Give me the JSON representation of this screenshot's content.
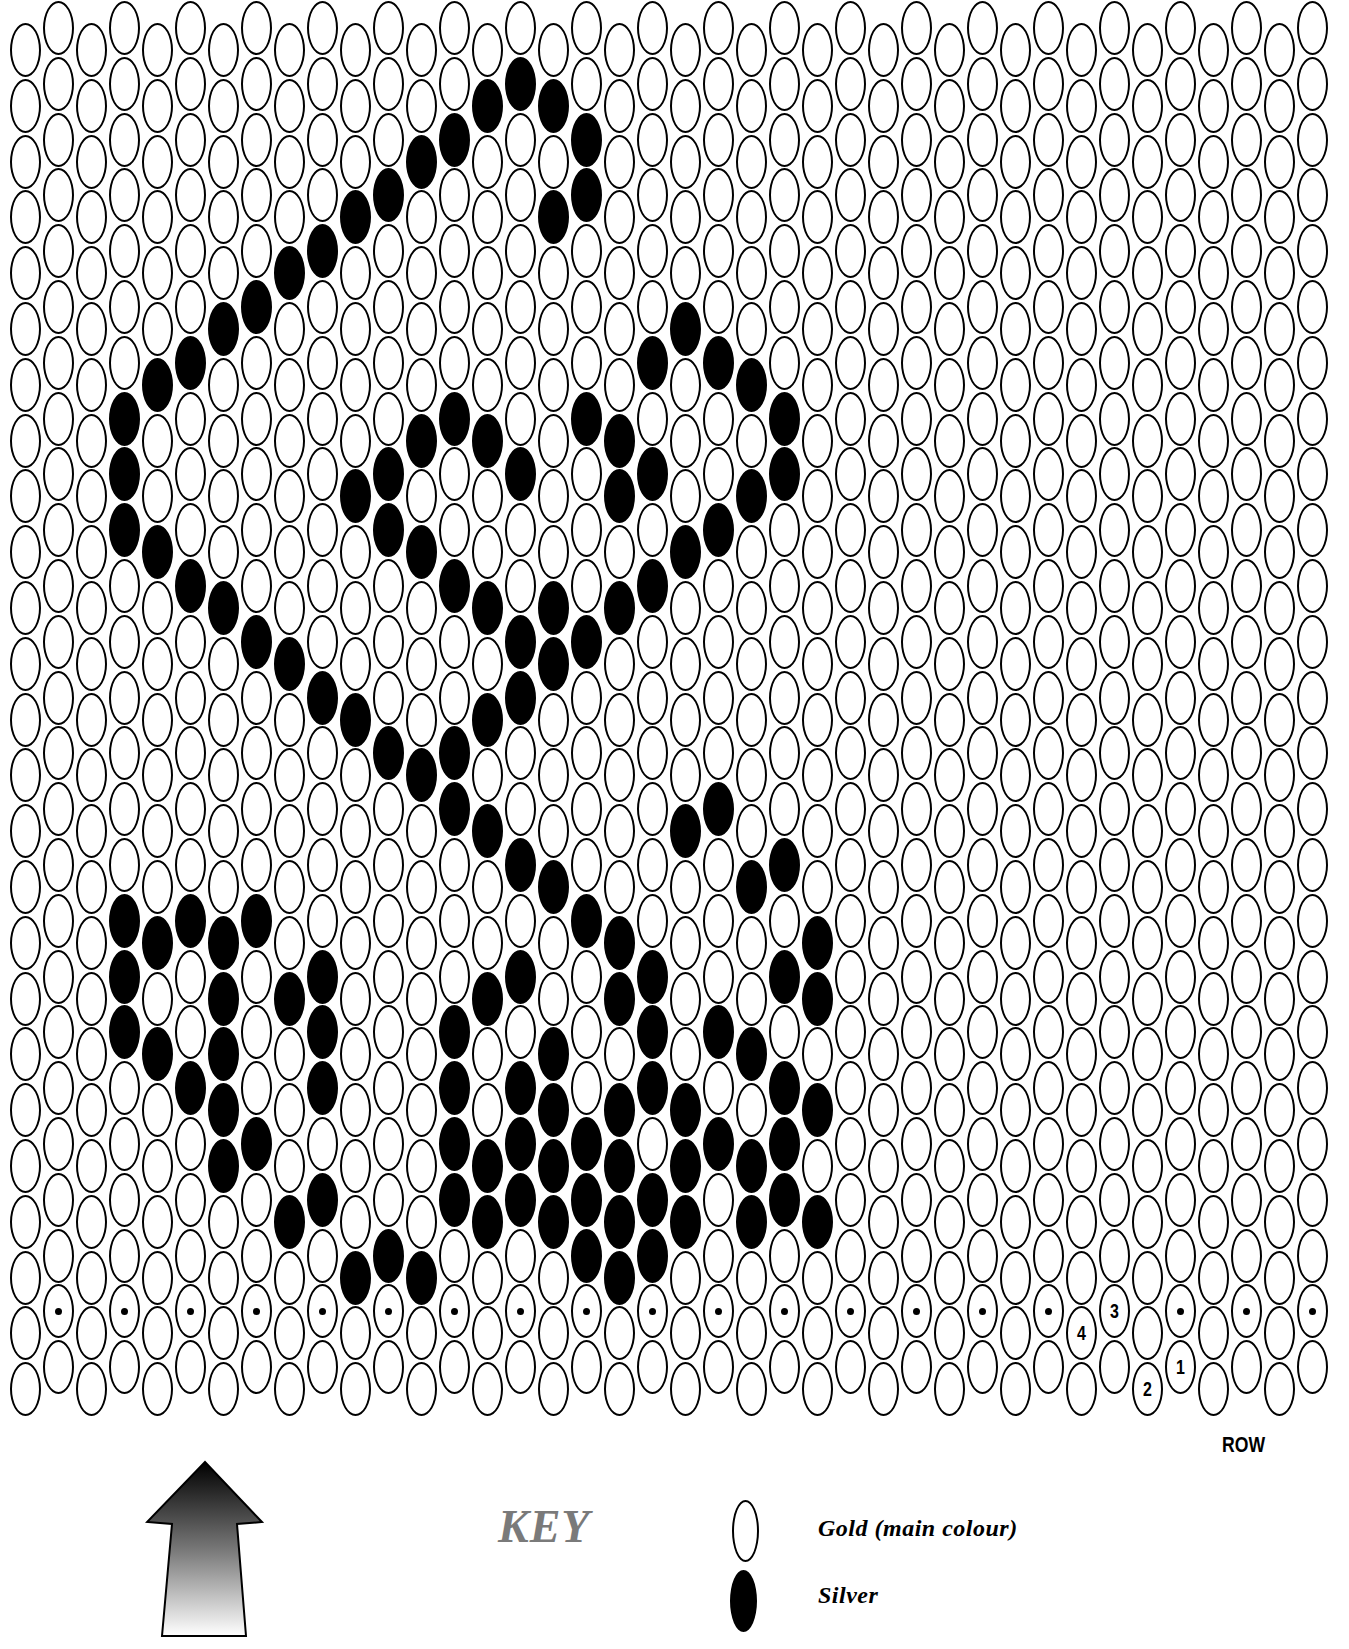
{
  "chart": {
    "type": "peyote bead pattern",
    "columns": 40,
    "rows_per_column": 25,
    "odd_columns_raised": true,
    "colors": {
      "gold": "#ffffff",
      "silver": "#000000",
      "outline": "#000000"
    },
    "silver_beads": [
      [
        15,
        1
      ],
      [
        14,
        1
      ],
      [
        16,
        1
      ],
      [
        17,
        2
      ],
      [
        17,
        3
      ],
      [
        16,
        3
      ],
      [
        13,
        2
      ],
      [
        12,
        2
      ],
      [
        11,
        3
      ],
      [
        10,
        3
      ],
      [
        9,
        4
      ],
      [
        8,
        4
      ],
      [
        7,
        5
      ],
      [
        6,
        5
      ],
      [
        5,
        6
      ],
      [
        4,
        6
      ],
      [
        3,
        7
      ],
      [
        3,
        8
      ],
      [
        3,
        9
      ],
      [
        4,
        9
      ],
      [
        5,
        10
      ],
      [
        6,
        10
      ],
      [
        7,
        11
      ],
      [
        8,
        11
      ],
      [
        9,
        12
      ],
      [
        10,
        12
      ],
      [
        11,
        13
      ],
      [
        12,
        13
      ],
      [
        13,
        14
      ],
      [
        14,
        14
      ],
      [
        15,
        15
      ],
      [
        16,
        15
      ],
      [
        17,
        16
      ],
      [
        18,
        16
      ],
      [
        19,
        17
      ],
      [
        20,
        5
      ],
      [
        21,
        6
      ],
      [
        22,
        6
      ],
      [
        23,
        7
      ],
      [
        23,
        8
      ],
      [
        22,
        8
      ],
      [
        21,
        9
      ],
      [
        20,
        9
      ],
      [
        19,
        10
      ],
      [
        18,
        10
      ],
      [
        17,
        11
      ],
      [
        16,
        11
      ],
      [
        15,
        12
      ],
      [
        14,
        12
      ],
      [
        13,
        13
      ],
      [
        19,
        6
      ],
      [
        18,
        7
      ],
      [
        17,
        7
      ],
      [
        18,
        8
      ],
      [
        19,
        8
      ],
      [
        12,
        7
      ],
      [
        13,
        7
      ],
      [
        14,
        7
      ],
      [
        15,
        8
      ],
      [
        11,
        8
      ],
      [
        10,
        8
      ],
      [
        11,
        9
      ],
      [
        12,
        9
      ],
      [
        13,
        10
      ],
      [
        14,
        10
      ],
      [
        15,
        11
      ],
      [
        16,
        10
      ],
      [
        20,
        14
      ],
      [
        21,
        14
      ],
      [
        22,
        15
      ],
      [
        23,
        15
      ],
      [
        24,
        16
      ],
      [
        24,
        17
      ],
      [
        23,
        17
      ],
      [
        22,
        18
      ],
      [
        21,
        18
      ],
      [
        20,
        19
      ],
      [
        20,
        20
      ],
      [
        21,
        20
      ],
      [
        22,
        20
      ],
      [
        22,
        21
      ],
      [
        23,
        19
      ],
      [
        23,
        20
      ],
      [
        24,
        19
      ],
      [
        24,
        21
      ],
      [
        23,
        21
      ],
      [
        4,
        16
      ],
      [
        3,
        16
      ],
      [
        3,
        17
      ],
      [
        3,
        18
      ],
      [
        4,
        18
      ],
      [
        5,
        19
      ],
      [
        6,
        19
      ],
      [
        6,
        20
      ],
      [
        7,
        20
      ],
      [
        8,
        21
      ],
      [
        9,
        21
      ],
      [
        10,
        22
      ],
      [
        11,
        22
      ],
      [
        12,
        22
      ],
      [
        5,
        16
      ],
      [
        6,
        16
      ],
      [
        6,
        17
      ],
      [
        6,
        18
      ],
      [
        7,
        16
      ],
      [
        8,
        17
      ],
      [
        9,
        17
      ],
      [
        9,
        18
      ],
      [
        9,
        19
      ],
      [
        6,
        19
      ],
      [
        13,
        18
      ],
      [
        13,
        19
      ],
      [
        13,
        20
      ],
      [
        13,
        21
      ],
      [
        14,
        17
      ],
      [
        15,
        17
      ],
      [
        15,
        19
      ],
      [
        16,
        18
      ],
      [
        16,
        19
      ],
      [
        16,
        20
      ],
      [
        16,
        21
      ],
      [
        17,
        21
      ],
      [
        17,
        22
      ],
      [
        15,
        20
      ],
      [
        15,
        21
      ],
      [
        14,
        20
      ],
      [
        14,
        21
      ],
      [
        18,
        17
      ],
      [
        19,
        18
      ],
      [
        18,
        19
      ],
      [
        19,
        19
      ],
      [
        18,
        20
      ],
      [
        18,
        21
      ],
      [
        19,
        21
      ],
      [
        20,
        21
      ],
      [
        19,
        22
      ],
      [
        18,
        22
      ],
      [
        17,
        20
      ]
    ],
    "start_markers": {
      "row_dots_on_odd_columns": true,
      "dot_row_index": 23,
      "numbers": [
        {
          "label": "4",
          "col": 32,
          "row": 23
        },
        {
          "label": "3",
          "col": 33,
          "row": 23
        },
        {
          "label": "2",
          "col": 34,
          "row": 24
        },
        {
          "label": "1",
          "col": 35,
          "row": 24
        }
      ]
    },
    "row_label": "ROW"
  },
  "direction_arrow": {
    "icon": "up-arrow-gradient"
  },
  "key": {
    "title": "KEY",
    "items": [
      {
        "swatch": "outline",
        "label": "Gold (main colour)"
      },
      {
        "swatch": "filled",
        "label": "Silver"
      }
    ]
  }
}
